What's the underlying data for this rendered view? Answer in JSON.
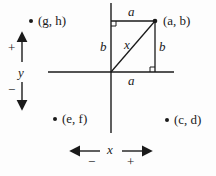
{
  "diagram": {
    "points": [
      {
        "label": "(a, b)",
        "x": 155,
        "y": 21
      },
      {
        "label": "(g, h)",
        "x": 31,
        "y": 21
      },
      {
        "label": "(e, f)",
        "x": 55,
        "y": 119
      },
      {
        "label": "(c, d)",
        "x": 167,
        "y": 120
      }
    ],
    "segment_labels": {
      "top": "a",
      "bottom": "a",
      "left": "b",
      "right": "b",
      "hypotenuse": "x"
    },
    "axis_indicators": {
      "y_label": "y",
      "y_plus": "+",
      "y_minus": "−",
      "x_label": "x",
      "x_minus": "−",
      "x_plus": "+"
    },
    "colors": {
      "ink": "#1a1a1a",
      "background": "#fdfdfd"
    }
  }
}
